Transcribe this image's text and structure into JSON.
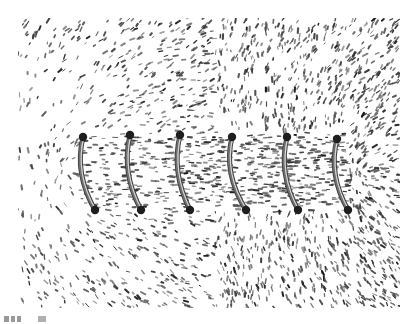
{
  "figure": {
    "photo_box": {
      "x": 18,
      "y": 18,
      "w": 382,
      "h": 290
    },
    "background_color": "#ffffff",
    "filings_color": "#2a2a2a",
    "coil_color": "#6e6e6e",
    "coil_highlight": "#d8d8d8",
    "coil_end_color": "#1e1e1e",
    "coil_turns": [
      {
        "top": [
          83,
          137
        ],
        "bottom": [
          95,
          210
        ]
      },
      {
        "top": [
          130,
          135
        ],
        "bottom": [
          141,
          210
        ]
      },
      {
        "top": [
          180,
          135
        ],
        "bottom": [
          190,
          210
        ]
      },
      {
        "top": [
          232,
          137
        ],
        "bottom": [
          246,
          210
        ]
      },
      {
        "top": [
          287,
          137
        ],
        "bottom": [
          298,
          210
        ]
      },
      {
        "top": [
          337,
          139
        ],
        "bottom": [
          348,
          210
        ]
      }
    ],
    "filings": {
      "seed": 7,
      "count": 2600,
      "density_gradient": "sparse at left, dense at right and along coil axis",
      "axis_y": 172
    }
  },
  "caption": {
    "text": "",
    "note": "partially clipped caption text at bottom edge, unreadable"
  }
}
